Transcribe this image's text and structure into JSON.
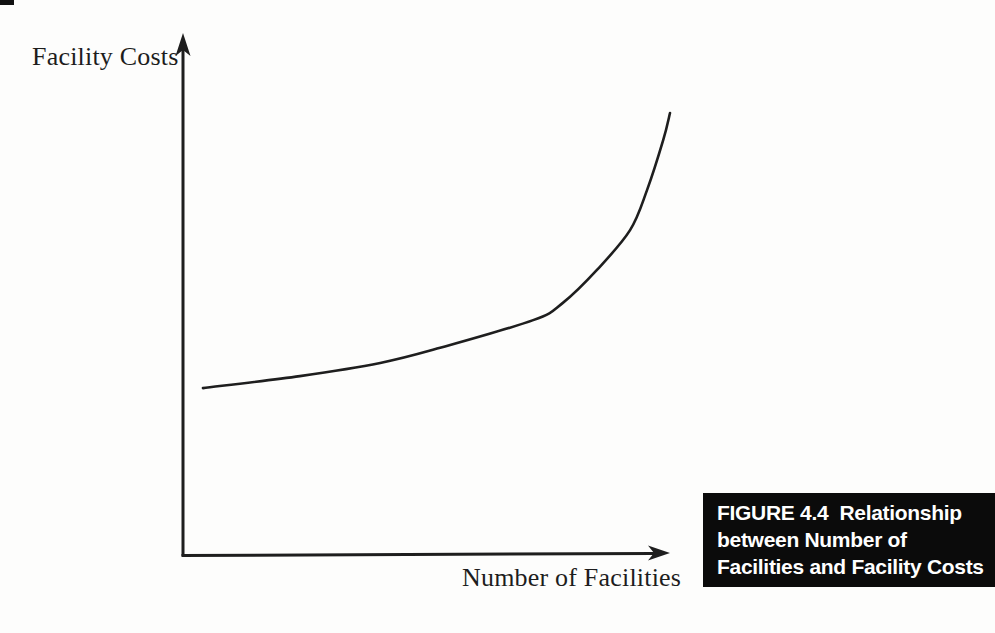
{
  "figure": {
    "y_axis_label": "Facility Costs",
    "x_axis_label": "Number of Facilities",
    "caption": {
      "lines": [
        "FIGURE 4.4  Relationship",
        "between Number of",
        "Facilities and Facility Costs"
      ],
      "bg_color": "#0b0b0b",
      "text_color": "#ffffff"
    },
    "ink_color": "#1e1e1e"
  },
  "chart_data": {
    "type": "line",
    "title": "FIGURE 4.4 Relationship between Number of Facilities and Facility Costs",
    "xlabel": "Number of Facilities",
    "ylabel": "Facility Costs",
    "x_range": [
      0,
      1
    ],
    "y_range": [
      0,
      1
    ],
    "grid": false,
    "legend": false,
    "axis_ticks": [],
    "series": [
      {
        "name": "Facility Costs vs Number of Facilities",
        "points": [
          [
            0.041,
            0.321
          ],
          [
            0.24,
            0.344
          ],
          [
            0.405,
            0.369
          ],
          [
            0.528,
            0.398
          ],
          [
            0.719,
            0.451
          ],
          [
            0.78,
            0.484
          ],
          [
            0.85,
            0.547
          ],
          [
            0.918,
            0.623
          ],
          [
            0.953,
            0.7
          ],
          [
            0.986,
            0.795
          ],
          [
            1.0,
            0.847
          ]
        ]
      }
    ]
  }
}
